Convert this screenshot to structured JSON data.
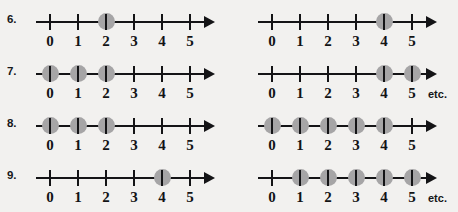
{
  "worksheet": {
    "background_color": "#f2f1ef",
    "axis_color": "#141416",
    "dot_color": "#a6a5a6",
    "tick_labels": [
      "0",
      "1",
      "2",
      "3",
      "4",
      "5"
    ],
    "etc_text": "etc.",
    "rows": [
      {
        "number_label": "6.",
        "left": {
          "marked_points": [
            2
          ],
          "has_etc": false,
          "etc_text": ""
        },
        "right": {
          "marked_points": [
            4
          ],
          "has_etc": false,
          "etc_text": ""
        }
      },
      {
        "number_label": "7.",
        "left": {
          "marked_points": [
            0,
            1,
            2
          ],
          "has_etc": false,
          "etc_text": ""
        },
        "right": {
          "marked_points": [
            4,
            5
          ],
          "has_etc": true,
          "etc_text": "etc."
        }
      },
      {
        "number_label": "8.",
        "left": {
          "marked_points": [
            0,
            1,
            2
          ],
          "has_etc": false,
          "etc_text": ""
        },
        "right": {
          "marked_points": [
            0,
            1,
            2,
            3,
            4
          ],
          "has_etc": false,
          "etc_text": ""
        }
      },
      {
        "number_label": "9.",
        "left": {
          "marked_points": [
            4
          ],
          "has_etc": false,
          "etc_text": ""
        },
        "right": {
          "marked_points": [
            1,
            2,
            3,
            4,
            5
          ],
          "has_etc": true,
          "etc_text": "etc."
        }
      }
    ]
  },
  "layout": {
    "row_tops": [
      10,
      62,
      114,
      166
    ],
    "tick_spacing": 28,
    "first_tick_offset": 14
  }
}
